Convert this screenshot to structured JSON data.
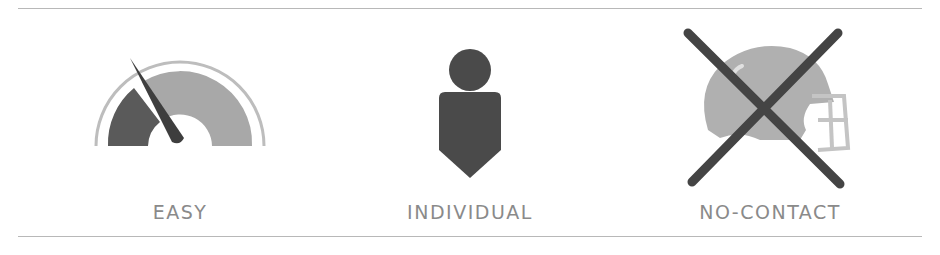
{
  "features": [
    {
      "label": "EASY",
      "icon": "speedometer-gauge-icon"
    },
    {
      "label": "INDIVIDUAL",
      "icon": "person-icon"
    },
    {
      "label": "NO-CONTACT",
      "icon": "crossed-out-football-helmet-icon"
    }
  ],
  "colors": {
    "dark": "#4a4a4a",
    "mid": "#a4a4a4",
    "light": "#bdbdbd",
    "label": "#8a8a8a",
    "rule": "#b8b8b8"
  }
}
